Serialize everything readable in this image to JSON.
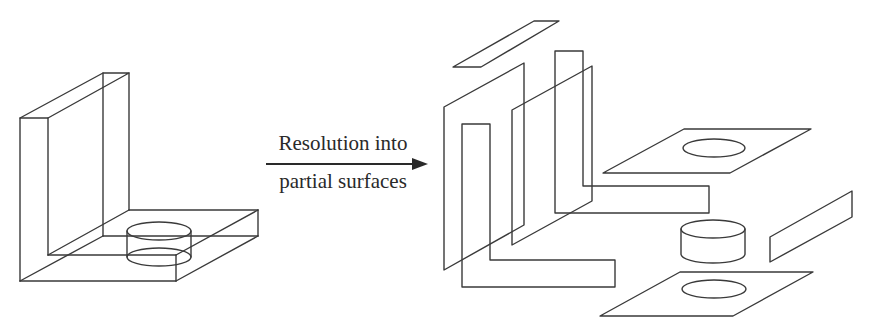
{
  "figure": {
    "transition_label_line1": "Resolution into",
    "transition_label_line2": "partial surfaces",
    "left_object": "L-shaped solid bracket with cylindrical boss on base plate",
    "right_object": "Exploded set of partial surfaces",
    "arrow_direction": "right",
    "stroke_color": "#3a3a3a",
    "background_color": "#ffffff"
  }
}
